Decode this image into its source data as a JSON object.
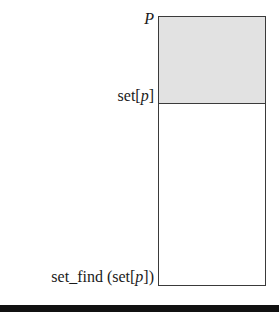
{
  "diagram": {
    "labels": {
      "top": "P",
      "middle_prefix": "set[",
      "middle_var": "p",
      "middle_suffix": "]",
      "bottom_prefix": "set_find (set[",
      "bottom_var": "p",
      "bottom_suffix": "])"
    },
    "regions": [
      {
        "name": "shaded-region",
        "fill": "#e2e2e2"
      },
      {
        "name": "empty-region",
        "fill": "#ffffff"
      }
    ],
    "colors": {
      "stroke": "#3a3a3a",
      "bar": "#111111"
    }
  }
}
